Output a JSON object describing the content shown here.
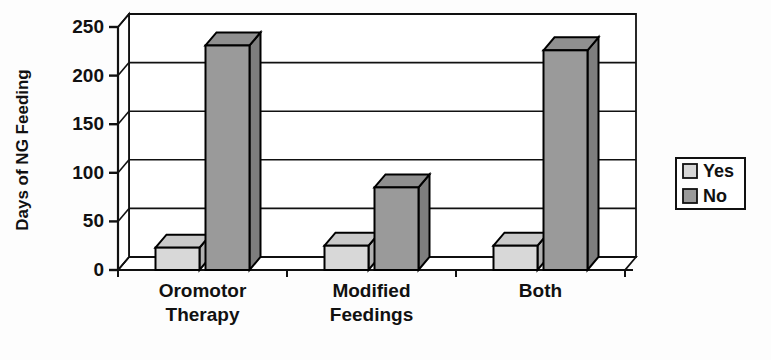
{
  "chart_data": {
    "type": "bar",
    "title": "",
    "subtitle": "",
    "xlabel": "",
    "ylabel": "Days of NG Feeding",
    "categories": [
      "Oromotor Therapy",
      "Modified Feedings",
      "Both"
    ],
    "category_lines": [
      [
        "Oromotor",
        "Therapy"
      ],
      [
        "Modified",
        "Feedings"
      ],
      [
        "Both"
      ]
    ],
    "series": [
      {
        "name": "Yes",
        "values": [
          23,
          25,
          25
        ],
        "color": "#d8d8d8"
      },
      {
        "name": "No",
        "values": [
          231,
          85,
          226
        ],
        "color": "#9a9a9a"
      }
    ],
    "ylim": [
      0,
      250
    ],
    "yticks": [
      0,
      50,
      100,
      150,
      200,
      250
    ],
    "ytick_labels": [
      "0",
      "50",
      "100",
      "150",
      "200",
      "250"
    ],
    "grid": true,
    "grid_axis": "y",
    "legend_position": "right",
    "legend_entries": [
      {
        "label": "Yes",
        "color": "#d8d8d8"
      },
      {
        "label": "No",
        "color": "#9a9a9a"
      }
    ],
    "style": "3d-column",
    "background": "#ffffff",
    "outline_color": "#000000"
  },
  "axes": {
    "y_title": "Days of NG Feeding"
  },
  "legend": {
    "items": [
      {
        "label": "Yes"
      },
      {
        "label": "No"
      }
    ]
  }
}
